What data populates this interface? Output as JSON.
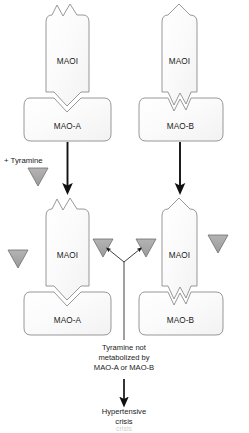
{
  "figure": {
    "background_color": "#ffffff",
    "width": 249,
    "height": 433
  },
  "colors": {
    "shape_fill": "#fbfbfb",
    "shape_stroke": "#8c8c8c",
    "triangle_fill": "#a8a8a8",
    "triangle_stroke": "#6e6e6e",
    "arrow": "#111111",
    "text": "#1a1a1a",
    "thin_line": "#2a2a2a"
  },
  "top_panel": {
    "left": {
      "inhibitor": {
        "label": "MAOI",
        "top_shape": "double-peak",
        "bottom_shape": "single-notch"
      },
      "enzyme": {
        "label": "MAO-A",
        "top_notch": "single-notch"
      }
    },
    "right": {
      "inhibitor": {
        "label": "MAOI",
        "top_shape": "single-peak",
        "bottom_shape": "double-notch"
      },
      "enzyme": {
        "label": "MAO-B",
        "top_notch": "double-notch"
      }
    }
  },
  "tyramine": {
    "label": "+ Tyramine",
    "marker_icon": "tyramine-triangle-icon"
  },
  "bottom_panel": {
    "left": {
      "inhibitor": {
        "label": "MAOI",
        "top_shape": "double-peak",
        "bottom_shape": "single-notch"
      },
      "enzyme": {
        "label": "MAO-A",
        "top_notch": "single-notch"
      },
      "tyramine_markers": 2
    },
    "right": {
      "inhibitor": {
        "label": "MAOI",
        "top_shape": "single-peak",
        "bottom_shape": "double-notch"
      },
      "enzyme": {
        "label": "MAO-B",
        "top_notch": "double-notch"
      },
      "tyramine_markers": 2
    }
  },
  "note": {
    "line1_prefix": "Tyramine ",
    "line1_emphasis": "not",
    "line2": "metabolized by",
    "line3": "MAO-A or MAO-B"
  },
  "outcome": {
    "line1": "Hypertensive",
    "line2": "crisis"
  },
  "caption_ghost": {
    "text": "crisis"
  }
}
